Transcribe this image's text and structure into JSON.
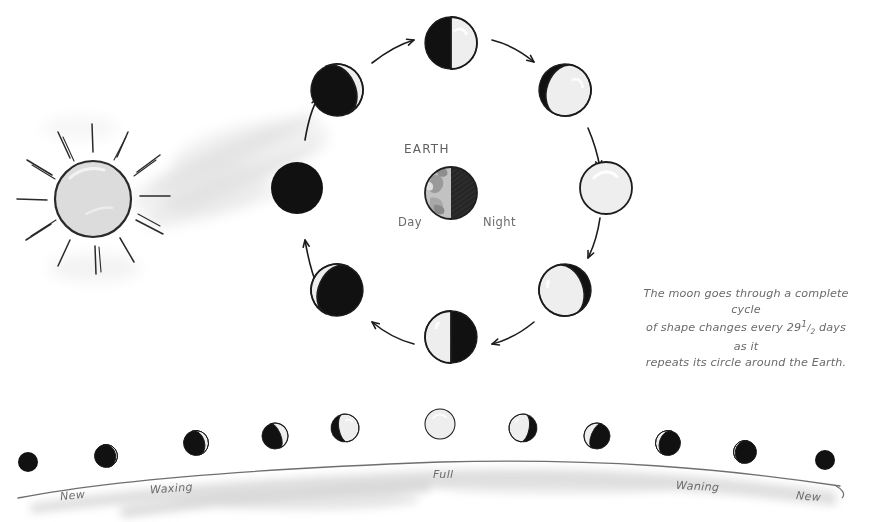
{
  "diagram": {
    "title_text": "",
    "earth": {
      "label": "EARTH",
      "day_label": "Day",
      "night_label": "Night",
      "center": [
        451,
        193
      ],
      "radius": 26,
      "day_fill": "#b9b9b9",
      "night_fill": "#2b2b2b"
    },
    "sun": {
      "name": "sun",
      "center": [
        93,
        199
      ],
      "radius": 38,
      "fill": "#dcdcdc",
      "outline": "#2a2a2a",
      "ray_count": 12
    },
    "caption": {
      "line1": "The moon goes through a complete cycle",
      "line2_pre": "of shape changes every 29",
      "line2_frac_num": "1",
      "line2_frac_den": "2",
      "line2_post": " days as it",
      "line3": "repeats its circle around the Earth.",
      "full_text": "The moon goes through a complete cycle of shape changes every 29 1/2 days as it repeats its circle around the Earth."
    },
    "orbit": {
      "note": "Eight moon phases arranged counterclockwise around the Earth; lit side always faces the Sun at left.",
      "direction": "counterclockwise",
      "moons": [
        {
          "name": "new-moon",
          "cx": 297,
          "cy": 188,
          "r": 26,
          "phase": "new",
          "lit": 0.0,
          "lit_side": "left",
          "tilt": 0
        },
        {
          "name": "waxing-crescent",
          "cx": 337,
          "cy": 90,
          "r": 26,
          "phase": "waxing crescent",
          "lit": 0.15,
          "lit_side": "right",
          "tilt": -25
        },
        {
          "name": "first-quarter",
          "cx": 451,
          "cy": 43,
          "r": 26,
          "phase": "first quarter",
          "lit": 0.5,
          "lit_side": "right",
          "tilt": 0
        },
        {
          "name": "waxing-gibbous",
          "cx": 565,
          "cy": 90,
          "r": 26,
          "phase": "waxing gibbous",
          "lit": 0.85,
          "lit_side": "right",
          "tilt": 20
        },
        {
          "name": "full-moon",
          "cx": 606,
          "cy": 188,
          "r": 26,
          "phase": "full",
          "lit": 1.0,
          "lit_side": "left",
          "tilt": 0
        },
        {
          "name": "waning-gibbous",
          "cx": 565,
          "cy": 290,
          "r": 26,
          "phase": "waning gibbous",
          "lit": 0.85,
          "lit_side": "left",
          "tilt": -20
        },
        {
          "name": "last-quarter",
          "cx": 451,
          "cy": 337,
          "r": 26,
          "phase": "last quarter",
          "lit": 0.5,
          "lit_side": "left",
          "tilt": 0
        },
        {
          "name": "waning-crescent",
          "cx": 337,
          "cy": 290,
          "r": 26,
          "phase": "waning crescent",
          "lit": 0.15,
          "lit_side": "left",
          "tilt": 25
        }
      ],
      "arrows": [
        {
          "name": "orbit-arrow-1",
          "d": "M 305 140 C 308 122 312 108 318 98"
        },
        {
          "name": "orbit-arrow-2",
          "d": "M 372 63 C 386 52 400 44 414 40"
        },
        {
          "name": "orbit-arrow-3",
          "d": "M 492 40 C 508 44 522 52 534 62"
        },
        {
          "name": "orbit-arrow-4",
          "d": "M 588 128 C 594 142 598 156 600 168"
        },
        {
          "name": "orbit-arrow-5",
          "d": "M 600 218 C 598 232 594 246 588 258"
        },
        {
          "name": "orbit-arrow-6",
          "d": "M 534 322 C 522 332 508 340 492 344"
        },
        {
          "name": "orbit-arrow-7",
          "d": "M 414 344 C 398 340 384 332 372 322"
        },
        {
          "name": "orbit-arrow-8",
          "d": "M 318 288 C 312 274 308 258 305 240"
        }
      ]
    },
    "strip": {
      "name": "phase-strip",
      "labels": [
        {
          "name": "strip-label-new-left",
          "text": "New",
          "x": 60,
          "y": 489,
          "rotate": -6
        },
        {
          "name": "strip-label-waxing",
          "text": "Waxing",
          "x": 150,
          "y": 482,
          "rotate": -4
        },
        {
          "name": "strip-label-full",
          "text": "Full",
          "x": 433,
          "y": 468,
          "rotate": 0
        },
        {
          "name": "strip-label-waning",
          "text": "Waning",
          "x": 676,
          "y": 480,
          "rotate": 3
        },
        {
          "name": "strip-label-new-right",
          "text": "New",
          "x": 796,
          "y": 490,
          "rotate": 5
        }
      ],
      "moons": [
        {
          "name": "strip-moon-new-left",
          "cx": 28,
          "cy": 462,
          "r": 10,
          "lit": 0.0,
          "lit_side": "right",
          "tilt": 0
        },
        {
          "name": "strip-moon-crescent-1",
          "cx": 106,
          "cy": 456,
          "r": 11.5,
          "lit": 0.08,
          "lit_side": "right",
          "tilt": -14
        },
        {
          "name": "strip-moon-crescent-2",
          "cx": 196,
          "cy": 443,
          "r": 12.5,
          "lit": 0.16,
          "lit_side": "right",
          "tilt": -18
        },
        {
          "name": "strip-moon-crescent-3",
          "cx": 275,
          "cy": 436,
          "r": 13,
          "lit": 0.28,
          "lit_side": "right",
          "tilt": -22
        },
        {
          "name": "strip-moon-gibbous-1",
          "cx": 345,
          "cy": 428,
          "r": 14,
          "lit": 0.72,
          "lit_side": "right",
          "tilt": -10
        },
        {
          "name": "strip-moon-full",
          "cx": 440,
          "cy": 424,
          "r": 15,
          "lit": 1.0,
          "lit_side": "right",
          "tilt": 0
        },
        {
          "name": "strip-moon-gibbous-2",
          "cx": 523,
          "cy": 428,
          "r": 14,
          "lit": 0.72,
          "lit_side": "left",
          "tilt": 10
        },
        {
          "name": "strip-moon-crescent-4",
          "cx": 597,
          "cy": 436,
          "r": 13,
          "lit": 0.28,
          "lit_side": "left",
          "tilt": 22
        },
        {
          "name": "strip-moon-crescent-5",
          "cx": 668,
          "cy": 443,
          "r": 12.5,
          "lit": 0.16,
          "lit_side": "left",
          "tilt": 18
        },
        {
          "name": "strip-moon-crescent-6",
          "cx": 745,
          "cy": 452,
          "r": 11.5,
          "lit": 0.08,
          "lit_side": "left",
          "tilt": 14
        },
        {
          "name": "strip-moon-new-right",
          "cx": 825,
          "cy": 460,
          "r": 10,
          "lit": 0.0,
          "lit_side": "left",
          "tilt": 0
        }
      ],
      "ground_line": "M 18 498 C 120 478 280 468 440 462 C 600 458 720 468 840 486"
    },
    "colors": {
      "ink": "#1c1c1c",
      "moon_dark": "#111111",
      "moon_light": "#eeeeee",
      "paper": "#ffffff",
      "smudge": "#e3e3e3",
      "text": "#6b6b6b"
    }
  }
}
